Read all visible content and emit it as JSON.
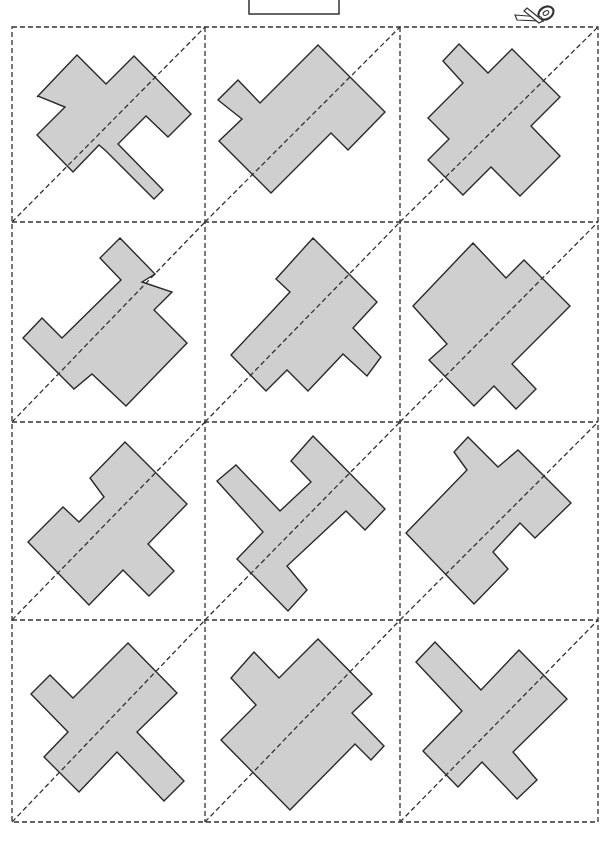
{
  "page": {
    "title_box_text": "",
    "colors": {
      "shape_fill": "#cfcfcf",
      "shape_stroke": "#2a2a2a",
      "cut_line": "#333333",
      "background": "#ffffff"
    }
  },
  "scissors": {
    "icon": "scissors-icon"
  },
  "grid": {
    "columns": [
      12,
      205,
      400,
      598
    ],
    "rows": [
      27,
      222,
      422,
      620,
      822
    ]
  },
  "cells": [
    {
      "row": 0,
      "col": 0,
      "points": [
        [
          77,
          55
        ],
        [
          106,
          84
        ],
        [
          134,
          56
        ],
        [
          191,
          114
        ],
        [
          168,
          137
        ],
        [
          146,
          116
        ],
        [
          118,
          144
        ],
        [
          163,
          190
        ],
        [
          154,
          199
        ],
        [
          100,
          145
        ],
        [
          73,
          172
        ],
        [
          37,
          135
        ],
        [
          65,
          107
        ],
        [
          38,
          96
        ],
        [
          38,
          97
        ],
        [
          37,
          97
        ]
      ]
    },
    {
      "row": 0,
      "col": 1,
      "points": [
        [
          318,
          45
        ],
        [
          385,
          112
        ],
        [
          348,
          150
        ],
        [
          331,
          133
        ],
        [
          271,
          193
        ],
        [
          219,
          141
        ],
        [
          242,
          119
        ],
        [
          218,
          100
        ],
        [
          238,
          80
        ],
        [
          260,
          103
        ]
      ]
    },
    {
      "row": 0,
      "col": 2,
      "points": [
        [
          459,
          44
        ],
        [
          488,
          73
        ],
        [
          512,
          49
        ],
        [
          560,
          97
        ],
        [
          531,
          126
        ],
        [
          560,
          156
        ],
        [
          520,
          196
        ],
        [
          491,
          167
        ],
        [
          463,
          195
        ],
        [
          428,
          160
        ],
        [
          449,
          139
        ],
        [
          428,
          118
        ],
        [
          463,
          83
        ],
        [
          443,
          61
        ]
      ]
    }
  ]
}
